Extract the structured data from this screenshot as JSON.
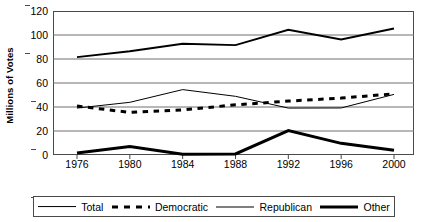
{
  "chart_data": {
    "type": "line",
    "title": "",
    "xlabel": "",
    "ylabel": "Millions of Votes",
    "x": [
      1976,
      1980,
      1984,
      1988,
      1992,
      1996,
      2000
    ],
    "xticklabels": [
      "1976",
      "1980",
      "1984",
      "1988",
      "1992",
      "1996",
      "2000"
    ],
    "yticklabels": [
      "0",
      "20",
      "40",
      "60",
      "80",
      "100",
      "120"
    ],
    "yticks": [
      0,
      20,
      40,
      60,
      80,
      100,
      120
    ],
    "ylim": [
      0,
      120
    ],
    "xlim": [
      1974,
      2002
    ],
    "grid": "horizontal",
    "legend_position": "bottom",
    "series": [
      {
        "name": "Total",
        "style": "solid-medium",
        "color": "#000000",
        "values": [
          81.6,
          86.5,
          92.7,
          91.6,
          104.4,
          96.3,
          105.4
        ]
      },
      {
        "name": "Democratic",
        "style": "dashed-thick",
        "color": "#000000",
        "values": [
          40.8,
          35.5,
          37.6,
          41.8,
          44.9,
          47.4,
          51.0
        ]
      },
      {
        "name": "Republican",
        "style": "solid-thin",
        "color": "#000000",
        "values": [
          39.1,
          43.9,
          54.5,
          48.9,
          39.1,
          39.2,
          50.5
        ]
      },
      {
        "name": "Other",
        "style": "solid-thick",
        "color": "#000000",
        "values": [
          1.6,
          7.1,
          0.7,
          0.9,
          20.4,
          9.7,
          3.9
        ]
      }
    ]
  },
  "legend": {
    "items": [
      {
        "label": "Total",
        "key": "total"
      },
      {
        "label": "Democratic",
        "key": "democratic"
      },
      {
        "label": "Republican",
        "key": "republican"
      },
      {
        "label": "Other",
        "key": "other"
      }
    ]
  }
}
